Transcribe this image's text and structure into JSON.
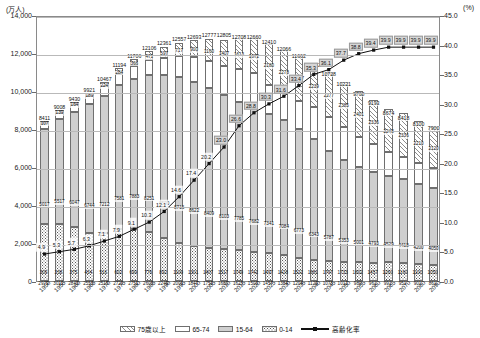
{
  "axes": {
    "left_unit": "(万人)",
    "right_unit": "(%)",
    "left_ticks": [
      "14,000",
      "12,000",
      "10,000",
      "8,000",
      "6,000",
      "4,000",
      "2,000",
      "0"
    ],
    "right_ticks": [
      "45.0",
      "40.0",
      "35.0",
      "30.0",
      "25.0",
      "20.0",
      "15.0",
      "10.0",
      "5.0",
      "0.0"
    ],
    "left_range": [
      0,
      14000
    ],
    "right_range": [
      0,
      45
    ]
  },
  "legend": [
    {
      "key": "s75",
      "label": "75歳以上"
    },
    {
      "key": "s6574",
      "label": "65-74"
    },
    {
      "key": "s1564",
      "label": "15-64"
    },
    {
      "key": "s014",
      "label": "0-14"
    },
    {
      "key": "line",
      "label": "高齢化率"
    }
  ],
  "chart_data": {
    "type": "bar",
    "title": "",
    "xlabel": "",
    "ylabel": "万人",
    "ylim": [
      0,
      14000
    ],
    "y2lim": [
      0,
      45
    ],
    "grid": true,
    "legend_position": "bottom",
    "categories": [
      "1950",
      "1955",
      "1960",
      "1965",
      "1970",
      "1975",
      "1980",
      "1985",
      "1990",
      "1995",
      "2000",
      "2005",
      "2010",
      "2015",
      "2020",
      "2025",
      "2030",
      "2035",
      "2040",
      "2045",
      "2050",
      "2055",
      "2060",
      "2065",
      "2070",
      "2080",
      "2090"
    ],
    "series": [
      {
        "name": "0-14",
        "values": [
          2979,
          3012,
          2843,
          2553,
          2515,
          2722,
          2751,
          2603,
          2249,
          2001,
          1847,
          1752,
          1680,
          1623,
          1503,
          1457,
          1384,
          1204,
          1129,
          1073,
          1012,
          989,
          961,
          991,
          951,
          901,
          861
        ]
      },
      {
        "name": "15-64",
        "values": [
          5017,
          5517,
          6047,
          6744,
          7212,
          7581,
          7883,
          8251,
          8590,
          8716,
          8622,
          8409,
          8103,
          7785,
          7682,
          7341,
          7084,
          6773,
          6343,
          5787,
          5353,
          5001,
          4793,
          4529,
          4418,
          4200,
          4050
        ]
      },
      {
        "name": "65-74",
        "values": [
          309,
          338,
          375,
          434,
          516,
          602,
          699,
          776,
          892,
          1109,
          1301,
          1407,
          1517,
          1749,
          1742,
          1497,
          1428,
          1522,
          1681,
          1797,
          1733,
          1602,
          1457,
          1260,
          1160,
          1100,
          1050
        ]
      },
      {
        "name": "75歳以上",
        "values": [
          107,
          139,
          164,
          189,
          224,
          284,
          366,
          471,
          597,
          717,
          900,
          1160,
          1407,
          1613,
          1872,
          2180,
          2278,
          2417,
          2239,
          2277,
          2385,
          2401,
          2336,
          2248,
          2336,
          2210,
          2120
        ]
      },
      {
        "name": "総数",
        "values": [
          8411,
          9008,
          9430,
          9921,
          10467,
          11194,
          11706,
          12106,
          12361,
          12557,
          12693,
          12777,
          12805,
          12708,
          12660,
          12410,
          12066,
          11662,
          11212,
          10728,
          10221,
          9708,
          9193,
          8674,
          8418,
          8100,
          7900
        ]
      }
    ],
    "line_series": {
      "name": "高齢化率",
      "unit": "%",
      "values": [
        4.9,
        5.3,
        5.7,
        6.3,
        7.1,
        7.9,
        9.1,
        10.3,
        12.1,
        14.6,
        17.4,
        20.2,
        23.0,
        26.6,
        28.8,
        30.3,
        31.6,
        33.4,
        35.3,
        36.1,
        37.7,
        38.8,
        39.4,
        39.9,
        39.9,
        39.9,
        39.9
      ]
    }
  }
}
